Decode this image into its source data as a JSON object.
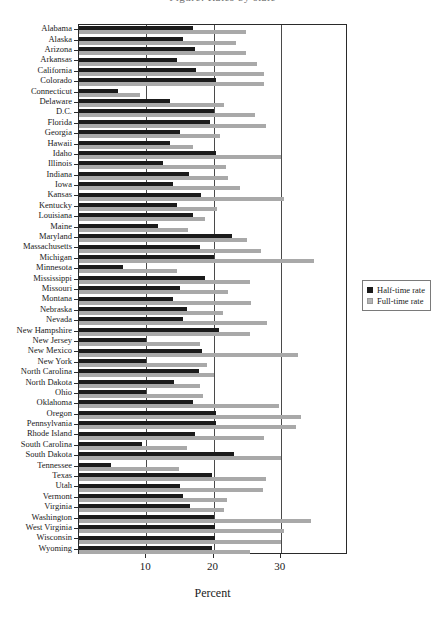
{
  "figure": {
    "title_fragment": "Figure: Rates by state",
    "xaxis_title": "Percent",
    "xtick_labels": [
      "10",
      "20",
      "30"
    ]
  },
  "legend": {
    "position": "right",
    "entries": [
      {
        "label": "Half-time rate",
        "color": "#1b1b1b",
        "key": "half"
      },
      {
        "label": "Full-time rate",
        "color": "#b4b4b4",
        "key": "full"
      }
    ]
  },
  "chart_data": {
    "type": "bar",
    "orientation": "horizontal",
    "title": "",
    "xlabel": "Percent",
    "ylabel": "",
    "xlim": [
      0,
      40
    ],
    "xticks": [
      10,
      20,
      30
    ],
    "grid": true,
    "legend_position": "right",
    "categories": [
      "Alabama",
      "Alaska",
      "Arizona",
      "Arkansas",
      "California",
      "Colorado",
      "Connecticut",
      "Delaware",
      "D.C.",
      "Florida",
      "Georgia",
      "Hawaii",
      "Idaho",
      "Illinois",
      "Indiana",
      "Iowa",
      "Kansas",
      "Kentucky",
      "Louisiana",
      "Maine",
      "Maryland",
      "Massachusetts",
      "Michigan",
      "Minnesota",
      "Mississippi",
      "Missouri",
      "Montana",
      "Nebraska",
      "Nevada",
      "New Hampshire",
      "New Jersey",
      "New Mexico",
      "New York",
      "North Carolina",
      "North Dakota",
      "Ohio",
      "Oklahoma",
      "Oregon",
      "Pennsylvania",
      "Rhode Island",
      "South Carolina",
      "South Dakota",
      "Tennessee",
      "Texas",
      "Utah",
      "Vermont",
      "Virginia",
      "Washington",
      "West Virginia",
      "Wisconsin",
      "Wyoming"
    ],
    "series": [
      {
        "name": "Half-time rate",
        "color": "#1b1b1b",
        "values": [
          17.0,
          15.5,
          17.3,
          14.5,
          17.4,
          20.4,
          5.8,
          13.6,
          20.0,
          19.5,
          15.0,
          13.5,
          20.4,
          12.5,
          16.4,
          14.0,
          18.2,
          14.6,
          17.0,
          11.8,
          22.8,
          18.0,
          20.0,
          6.5,
          18.8,
          15.0,
          14.0,
          16.0,
          15.5,
          20.8,
          10.0,
          18.3,
          10.0,
          17.8,
          14.2,
          10.0,
          17.0,
          20.4,
          20.4,
          17.2,
          9.3,
          23.0,
          4.8,
          19.8,
          15.0,
          15.5,
          16.5,
          20.0,
          20.2,
          20.2,
          19.8
        ]
      },
      {
        "name": "Full-time rate",
        "color": "#b4b4b4",
        "values": [
          24.8,
          23.4,
          24.8,
          26.5,
          27.5,
          27.5,
          9.0,
          21.5,
          26.2,
          27.8,
          21.0,
          17.0,
          30.0,
          21.8,
          22.2,
          24.0,
          30.5,
          20.5,
          18.8,
          16.2,
          25.0,
          27.0,
          35.0,
          14.5,
          25.5,
          22.2,
          25.6,
          21.4,
          28.0,
          25.5,
          18.0,
          32.5,
          19.0,
          20.0,
          18.0,
          18.5,
          29.8,
          33.0,
          32.3,
          27.5,
          16.0,
          30.0,
          14.8,
          27.8,
          27.4,
          22.0,
          21.5,
          34.5,
          30.5,
          30.0,
          25.4
        ]
      }
    ]
  }
}
